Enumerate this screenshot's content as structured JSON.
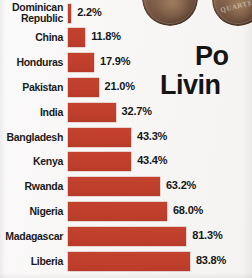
{
  "headline": {
    "line1": "Po",
    "line2": "Livin"
  },
  "coins": [
    {
      "name": "coin-penny",
      "legend": ""
    },
    {
      "name": "coin-quarter",
      "legend": "QUARTER"
    }
  ],
  "chart_data": {
    "type": "bar",
    "orientation": "horizontal",
    "title": "",
    "xlabel": "",
    "ylabel": "",
    "xlim": [
      0,
      90
    ],
    "grid": false,
    "legend": null,
    "value_suffix": "%",
    "bar_color": "#c4422e",
    "categories": [
      "Dominican Republic",
      "China",
      "Honduras",
      "Pakistan",
      "India",
      "Bangladesh",
      "Kenya",
      "Rwanda",
      "Nigeria",
      "Madagascar",
      "Liberia"
    ],
    "values": [
      2.2,
      11.8,
      17.9,
      21.0,
      32.7,
      43.3,
      43.4,
      63.2,
      68.0,
      81.3,
      83.8
    ],
    "value_labels": [
      "2.2%",
      "11.8%",
      "17.9%",
      "21.0%",
      "32.7%",
      "43.3%",
      "43.4%",
      "63.2%",
      "68.0%",
      "81.3%",
      "83.8%"
    ]
  }
}
